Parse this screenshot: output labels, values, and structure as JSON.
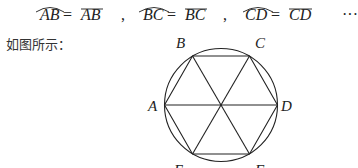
{
  "equations": [
    {
      "arc": "AB",
      "chord": "AB"
    },
    {
      "arc": "BC",
      "chord": "BC"
    },
    {
      "arc": "CD",
      "chord": "CD"
    }
  ],
  "equals_sign": "=",
  "separator": ",",
  "ellipsis": "···",
  "intro_text": "如图所示：",
  "figure": {
    "type": "regular hexagon inscribed in circle with diagonals through center",
    "vertex_labels": {
      "B": "B",
      "C": "C",
      "A": "A",
      "D": "D",
      "E": "E",
      "F": "F"
    }
  }
}
